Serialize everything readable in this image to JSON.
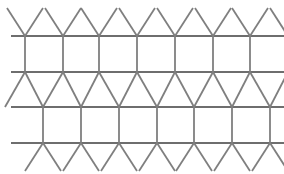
{
  "figure": {
    "caption": "",
    "type": "geometric-tiling-diagram"
  },
  "canvas": {
    "width": 284,
    "height": 174,
    "background_color": "#ffffff"
  },
  "style": {
    "stroke_color": "#7f7f7f",
    "stroke_color_dark": "#6e6e6e",
    "stroke_width": 2.0,
    "stroke_width_thin": 1.8,
    "line_cap": "butt"
  },
  "geometry": {
    "horizontal_lines": [
      {
        "name": "line-1",
        "y": 36,
        "x_start": 11,
        "x_end": 284
      },
      {
        "name": "line-2",
        "y": 72,
        "x_start": 11,
        "x_end": 284
      },
      {
        "name": "line-3",
        "y": 107,
        "x_start": 11,
        "x_end": 284
      },
      {
        "name": "line-4",
        "y": 143,
        "x_start": 11,
        "x_end": 284
      }
    ],
    "upper_vertex_x": [
      25,
      63,
      99,
      137,
      175,
      213,
      250
    ],
    "lower_vertex_x": [
      43,
      81,
      119,
      157,
      194,
      232,
      270
    ],
    "square_band_top": {
      "y_top": 36,
      "y_bottom": 72
    },
    "square_band_bottom": {
      "y_top": 107,
      "y_bottom": 143
    },
    "triangle_band": {
      "y_top": 72,
      "y_bottom": 107
    },
    "top_fringe": {
      "y_apex": 36,
      "y_cut": 8,
      "half_spread": 18
    },
    "bottom_fringe": {
      "y_apex": 143,
      "y_cut": 171,
      "half_spread": 18
    }
  },
  "counts": {
    "horizontal_lines": 4,
    "upper_verticals": 7,
    "lower_verticals": 7,
    "top_v_shapes": 7,
    "bottom_v_shapes": 7
  }
}
